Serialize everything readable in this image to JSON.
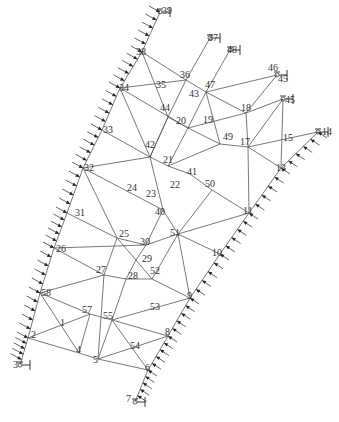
{
  "diagram": {
    "type": "truss-mesh",
    "colors": {
      "line": "#555555",
      "text": "#333333",
      "load": "#222222",
      "background": "#ffffff"
    },
    "nodes": [
      {
        "id": "39",
        "x": 160,
        "y": 12,
        "support": true
      },
      {
        "id": "38",
        "x": 142,
        "y": 52
      },
      {
        "id": "34",
        "x": 120,
        "y": 88
      },
      {
        "id": "33",
        "x": 102,
        "y": 130
      },
      {
        "id": "32",
        "x": 83,
        "y": 168
      },
      {
        "id": "31",
        "x": 67,
        "y": 213
      },
      {
        "id": "26",
        "x": 54,
        "y": 248
      },
      {
        "id": "58",
        "x": 40,
        "y": 293
      },
      {
        "id": "2",
        "x": 28,
        "y": 338
      },
      {
        "id": "3",
        "x": 20,
        "y": 365,
        "support": true
      },
      {
        "id": "37",
        "x": 210,
        "y": 38,
        "support": true
      },
      {
        "id": "48",
        "x": 230,
        "y": 50,
        "support": true
      },
      {
        "id": "36",
        "x": 186,
        "y": 80
      },
      {
        "id": "47",
        "x": 206,
        "y": 92
      },
      {
        "id": "44",
        "x": 168,
        "y": 117
      },
      {
        "id": "20",
        "x": 188,
        "y": 128
      },
      {
        "id": "18",
        "x": 246,
        "y": 113
      },
      {
        "id": "45a",
        "x": 277,
        "y": 75,
        "support": true
      },
      {
        "id": "45b",
        "x": 283,
        "y": 99,
        "support": true
      },
      {
        "id": "49",
        "x": 220,
        "y": 144
      },
      {
        "id": "17",
        "x": 248,
        "y": 147
      },
      {
        "id": "14",
        "x": 318,
        "y": 132,
        "support": true
      },
      {
        "id": "42",
        "x": 150,
        "y": 157
      },
      {
        "id": "21",
        "x": 168,
        "y": 166
      },
      {
        "id": "41",
        "x": 190,
        "y": 174
      },
      {
        "id": "50",
        "x": 212,
        "y": 190
      },
      {
        "id": "40",
        "x": 163,
        "y": 210
      },
      {
        "id": "13",
        "x": 281,
        "y": 168
      },
      {
        "id": "11",
        "x": 249,
        "y": 213
      },
      {
        "id": "25",
        "x": 117,
        "y": 238
      },
      {
        "id": "30",
        "x": 146,
        "y": 245
      },
      {
        "id": "51",
        "x": 178,
        "y": 234
      },
      {
        "id": "10",
        "x": 220,
        "y": 254
      },
      {
        "id": "29",
        "x": 136,
        "y": 260
      },
      {
        "id": "52",
        "x": 152,
        "y": 279
      },
      {
        "id": "28",
        "x": 126,
        "y": 279
      },
      {
        "id": "27",
        "x": 104,
        "y": 275
      },
      {
        "id": "9",
        "x": 190,
        "y": 298
      },
      {
        "id": "55",
        "x": 112,
        "y": 320
      },
      {
        "id": "57",
        "x": 90,
        "y": 314
      },
      {
        "id": "8",
        "x": 168,
        "y": 336
      },
      {
        "id": "4",
        "x": 79,
        "y": 353
      },
      {
        "id": "5",
        "x": 98,
        "y": 359
      },
      {
        "id": "6",
        "x": 148,
        "y": 370
      },
      {
        "id": "7",
        "x": 135,
        "y": 402,
        "support": true
      }
    ],
    "labels": [
      {
        "text": "39",
        "x": 162,
        "y": 6
      },
      {
        "text": "38",
        "x": 136,
        "y": 47
      },
      {
        "text": "34",
        "x": 119,
        "y": 83
      },
      {
        "text": "33",
        "x": 103,
        "y": 125
      },
      {
        "text": "32",
        "x": 84,
        "y": 163
      },
      {
        "text": "31",
        "x": 75,
        "y": 208
      },
      {
        "text": "26",
        "x": 56,
        "y": 244
      },
      {
        "text": "58",
        "x": 41,
        "y": 288
      },
      {
        "text": "2",
        "x": 31,
        "y": 330
      },
      {
        "text": "3",
        "x": 13,
        "y": 360
      },
      {
        "text": "37",
        "x": 208,
        "y": 33
      },
      {
        "text": "48",
        "x": 227,
        "y": 45
      },
      {
        "text": "36",
        "x": 180,
        "y": 70
      },
      {
        "text": "35",
        "x": 156,
        "y": 80
      },
      {
        "text": "47",
        "x": 205,
        "y": 80
      },
      {
        "text": "43",
        "x": 189,
        "y": 89
      },
      {
        "text": "44",
        "x": 160,
        "y": 103
      },
      {
        "text": "20",
        "x": 176,
        "y": 116
      },
      {
        "text": "19",
        "x": 203,
        "y": 115
      },
      {
        "text": "18",
        "x": 241,
        "y": 103
      },
      {
        "text": "46",
        "x": 268,
        "y": 63
      },
      {
        "text": "45",
        "x": 278,
        "y": 74
      },
      {
        "text": "45",
        "x": 285,
        "y": 95
      },
      {
        "text": "49",
        "x": 223,
        "y": 132
      },
      {
        "text": "17",
        "x": 240,
        "y": 137
      },
      {
        "text": "15",
        "x": 283,
        "y": 133
      },
      {
        "text": "14",
        "x": 322,
        "y": 127
      },
      {
        "text": "42",
        "x": 145,
        "y": 140
      },
      {
        "text": "21",
        "x": 163,
        "y": 155
      },
      {
        "text": "41",
        "x": 187,
        "y": 167
      },
      {
        "text": "50",
        "x": 205,
        "y": 179
      },
      {
        "text": "22",
        "x": 170,
        "y": 180
      },
      {
        "text": "24",
        "x": 127,
        "y": 183
      },
      {
        "text": "23",
        "x": 146,
        "y": 189
      },
      {
        "text": "40",
        "x": 155,
        "y": 207
      },
      {
        "text": "13",
        "x": 276,
        "y": 163
      },
      {
        "text": "11",
        "x": 243,
        "y": 206
      },
      {
        "text": "25",
        "x": 119,
        "y": 229
      },
      {
        "text": "30",
        "x": 140,
        "y": 237
      },
      {
        "text": "51",
        "x": 170,
        "y": 228
      },
      {
        "text": "10",
        "x": 212,
        "y": 248
      },
      {
        "text": "29",
        "x": 142,
        "y": 254
      },
      {
        "text": "52",
        "x": 150,
        "y": 266
      },
      {
        "text": "28",
        "x": 128,
        "y": 271
      },
      {
        "text": "27",
        "x": 96,
        "y": 265
      },
      {
        "text": "9",
        "x": 187,
        "y": 291
      },
      {
        "text": "53",
        "x": 150,
        "y": 302
      },
      {
        "text": "55",
        "x": 103,
        "y": 311
      },
      {
        "text": "57",
        "x": 82,
        "y": 305
      },
      {
        "text": "1",
        "x": 60,
        "y": 318
      },
      {
        "text": "8",
        "x": 165,
        "y": 327
      },
      {
        "text": "4",
        "x": 76,
        "y": 345
      },
      {
        "text": "5",
        "x": 93,
        "y": 355
      },
      {
        "text": "54",
        "x": 130,
        "y": 341
      },
      {
        "text": "6",
        "x": 145,
        "y": 363
      },
      {
        "text": "7",
        "x": 126,
        "y": 394
      }
    ],
    "edges": [
      [
        "39",
        "38"
      ],
      [
        "38",
        "34"
      ],
      [
        "34",
        "33"
      ],
      [
        "33",
        "32"
      ],
      [
        "32",
        "31"
      ],
      [
        "31",
        "26"
      ],
      [
        "26",
        "58"
      ],
      [
        "58",
        "2"
      ],
      [
        "2",
        "3"
      ],
      [
        "38",
        "36"
      ],
      [
        "38",
        "44"
      ],
      [
        "34",
        "36"
      ],
      [
        "34",
        "20"
      ],
      [
        "34",
        "42"
      ],
      [
        "36",
        "37"
      ],
      [
        "36",
        "47"
      ],
      [
        "36",
        "44"
      ],
      [
        "47",
        "48"
      ],
      [
        "44",
        "20"
      ],
      [
        "44",
        "42"
      ],
      [
        "20",
        "47"
      ],
      [
        "20",
        "49"
      ],
      [
        "47",
        "18"
      ],
      [
        "47",
        "45a"
      ],
      [
        "47",
        "49"
      ],
      [
        "18",
        "45a"
      ],
      [
        "18",
        "45b"
      ],
      [
        "18",
        "17"
      ],
      [
        "18",
        "20"
      ],
      [
        "49",
        "17"
      ],
      [
        "49",
        "21"
      ],
      [
        "17",
        "45b"
      ],
      [
        "17",
        "14"
      ],
      [
        "17",
        "13"
      ],
      [
        "17",
        "11"
      ],
      [
        "45b",
        "13"
      ],
      [
        "13",
        "14"
      ],
      [
        "13",
        "11"
      ],
      [
        "33",
        "42"
      ],
      [
        "32",
        "42"
      ],
      [
        "32",
        "40"
      ],
      [
        "32",
        "25"
      ],
      [
        "42",
        "21"
      ],
      [
        "42",
        "40"
      ],
      [
        "21",
        "41"
      ],
      [
        "41",
        "50"
      ],
      [
        "50",
        "11"
      ],
      [
        "50",
        "51"
      ],
      [
        "21",
        "22"
      ],
      [
        "22",
        "40"
      ],
      [
        "24",
        "25"
      ],
      [
        "40",
        "51"
      ],
      [
        "40",
        "30"
      ],
      [
        "11",
        "51"
      ],
      [
        "11",
        "10"
      ],
      [
        "10",
        "9"
      ],
      [
        "9",
        "8"
      ],
      [
        "8",
        "6"
      ],
      [
        "6",
        "7"
      ],
      [
        "31",
        "25"
      ],
      [
        "25",
        "30"
      ],
      [
        "25",
        "29"
      ],
      [
        "25",
        "27"
      ],
      [
        "30",
        "51"
      ],
      [
        "51",
        "52"
      ],
      [
        "51",
        "10"
      ],
      [
        "51",
        "9"
      ],
      [
        "29",
        "28"
      ],
      [
        "29",
        "52"
      ],
      [
        "29",
        "30"
      ],
      [
        "26",
        "27"
      ],
      [
        "27",
        "28"
      ],
      [
        "27",
        "58"
      ],
      [
        "27",
        "5"
      ],
      [
        "28",
        "52"
      ],
      [
        "28",
        "55"
      ],
      [
        "52",
        "9"
      ],
      [
        "52",
        "53"
      ],
      [
        "58",
        "57"
      ],
      [
        "58",
        "4"
      ],
      [
        "57",
        "55"
      ],
      [
        "57",
        "2"
      ],
      [
        "57",
        "4"
      ],
      [
        "55",
        "9"
      ],
      [
        "55",
        "8"
      ],
      [
        "55",
        "5"
      ],
      [
        "55",
        "6"
      ],
      [
        "2",
        "4"
      ],
      [
        "4",
        "5"
      ],
      [
        "5",
        "6"
      ],
      [
        "5",
        "8"
      ],
      [
        "42",
        "44"
      ],
      [
        "21",
        "20"
      ],
      [
        "26",
        "30"
      ]
    ]
  }
}
